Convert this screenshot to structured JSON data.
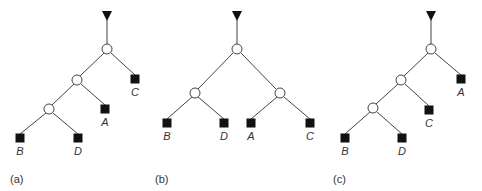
{
  "figure": {
    "panels": [
      {
        "id": "a",
        "caption": "(a)",
        "root": {
          "x": 107,
          "y": 15
        },
        "internal_nodes": [
          {
            "x": 107,
            "y": 49
          },
          {
            "x": 77,
            "y": 80
          },
          {
            "x": 49,
            "y": 109
          }
        ],
        "leaves": [
          {
            "label": "C",
            "x": 135,
            "y": 79
          },
          {
            "label": "A",
            "x": 105,
            "y": 109
          },
          {
            "label": "B",
            "x": 20,
            "y": 138
          },
          {
            "label": "D",
            "x": 78,
            "y": 138
          }
        ],
        "edges": [
          [
            107,
            20,
            107,
            44
          ],
          [
            104,
            53,
            80,
            76
          ],
          [
            111,
            53,
            135,
            75
          ],
          [
            74,
            84,
            52,
            105
          ],
          [
            81,
            84,
            105,
            105
          ],
          [
            46,
            113,
            20,
            134
          ],
          [
            53,
            113,
            78,
            134
          ]
        ],
        "caption_pos": {
          "x": 10,
          "y": 174
        }
      },
      {
        "id": "b",
        "caption": "(b)",
        "root": {
          "x": 237,
          "y": 15
        },
        "internal_nodes": [
          {
            "x": 237,
            "y": 49
          },
          {
            "x": 195,
            "y": 93
          },
          {
            "x": 280,
            "y": 93
          }
        ],
        "leaves": [
          {
            "label": "B",
            "x": 167,
            "y": 123
          },
          {
            "label": "D",
            "x": 224,
            "y": 123
          },
          {
            "label": "A",
            "x": 251,
            "y": 123
          },
          {
            "label": "C",
            "x": 310,
            "y": 123
          }
        ],
        "edges": [
          [
            237,
            20,
            237,
            44
          ],
          [
            233,
            53,
            198,
            89
          ],
          [
            241,
            53,
            276,
            89
          ],
          [
            192,
            97,
            167,
            119
          ],
          [
            198,
            97,
            224,
            119
          ],
          [
            277,
            97,
            251,
            119
          ],
          [
            284,
            97,
            310,
            119
          ]
        ],
        "caption_pos": {
          "x": 155,
          "y": 174
        }
      },
      {
        "id": "c",
        "caption": "(c)",
        "root": {
          "x": 431,
          "y": 15
        },
        "internal_nodes": [
          {
            "x": 431,
            "y": 49
          },
          {
            "x": 401,
            "y": 80
          },
          {
            "x": 373,
            "y": 108
          }
        ],
        "leaves": [
          {
            "label": "A",
            "x": 461,
            "y": 79
          },
          {
            "label": "C",
            "x": 429,
            "y": 110
          },
          {
            "label": "B",
            "x": 345,
            "y": 138
          },
          {
            "label": "D",
            "x": 402,
            "y": 138
          }
        ],
        "edges": [
          [
            431,
            20,
            431,
            44
          ],
          [
            428,
            53,
            404,
            76
          ],
          [
            435,
            53,
            461,
            75
          ],
          [
            398,
            84,
            376,
            104
          ],
          [
            405,
            84,
            429,
            106
          ],
          [
            370,
            112,
            345,
            134
          ],
          [
            377,
            112,
            402,
            134
          ]
        ],
        "caption_pos": {
          "x": 333,
          "y": 174
        }
      }
    ],
    "colors": {
      "line": "#444444",
      "node_fill": "#111111",
      "background": "#ffffff"
    }
  }
}
